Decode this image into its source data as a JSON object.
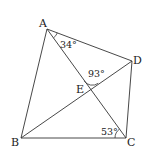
{
  "diagram": {
    "points": {
      "A": {
        "label": "A",
        "x": 47,
        "y": 29
      },
      "B": {
        "label": "B",
        "x": 21,
        "y": 138
      },
      "C": {
        "label": "C",
        "x": 126,
        "y": 138
      },
      "D": {
        "label": "D",
        "x": 132,
        "y": 61
      },
      "E": {
        "label": "E",
        "x": 90,
        "y": 89
      }
    },
    "segments": [
      "AB",
      "BC",
      "CD",
      "DA",
      "AC",
      "BD"
    ],
    "angles": {
      "DAC": {
        "label": "34°"
      },
      "AED": {
        "label": "93°"
      },
      "ACB": {
        "label": "53°"
      }
    }
  }
}
